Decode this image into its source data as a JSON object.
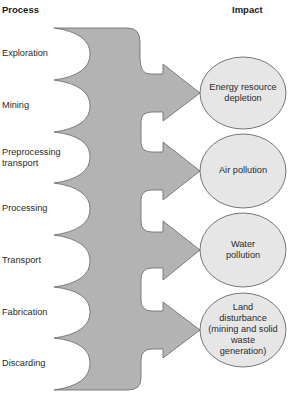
{
  "headers": {
    "process": "Process",
    "impact": "Impact"
  },
  "processes": [
    {
      "label": "Exploration"
    },
    {
      "label": "Mining"
    },
    {
      "label": "Preprocessing",
      "label2": "transport"
    },
    {
      "label": "Processing"
    },
    {
      "label": "Transport"
    },
    {
      "label": "Fabrication"
    },
    {
      "label": "Discarding"
    }
  ],
  "impacts": [
    {
      "lines": [
        "Energy resource",
        "depletion"
      ]
    },
    {
      "lines": [
        "Air pollution"
      ]
    },
    {
      "lines": [
        "Water",
        "pollution"
      ]
    },
    {
      "lines": [
        "Land",
        "disturbance",
        "(mining and solid",
        "waste",
        "generation)"
      ]
    }
  ],
  "colors": {
    "body_fill": "#b3b3b3",
    "ellipse_fill": "#e6e6e6",
    "stroke": "#555555"
  }
}
